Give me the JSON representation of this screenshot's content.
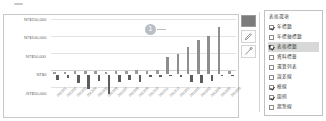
{
  "chart_data": {
    "type": "bar",
    "title": "",
    "xlabel": "",
    "ylabel": "",
    "ylim": [
      -50000,
      150000
    ],
    "grid": true,
    "legend_position": "right-panel",
    "ytick_labels": [
      "NT$150,000",
      "NT$100,000",
      "NT$50,000",
      "NT$0",
      "-NT$50,000"
    ],
    "ytick_values": [
      150000,
      100000,
      50000,
      0,
      -50000
    ],
    "categories": [
      "2022/01",
      "2022/02",
      "2022/03",
      "2022/04",
      "2022/05",
      "2022/06",
      "2022/07",
      "2022/08",
      "2022/09",
      "2022/10",
      "2022/11",
      "2022/12",
      "2023/01",
      "2023/02",
      "2023/03",
      "2023/04",
      "2023/05",
      "2023/06"
    ],
    "series": [
      {
        "name": "收入",
        "color": "#8e8e8e",
        "values": [
          8000,
          7000,
          9000,
          8500,
          9500,
          8000,
          9000,
          10000,
          11000,
          9000,
          12000,
          48000,
          56000,
          74000,
          92000,
          104000,
          128000,
          9000
        ]
      },
      {
        "name": "支出",
        "color": "#5d5d5d",
        "values": [
          -14000,
          -9000,
          -22000,
          -40000,
          -17000,
          -52000,
          -20000,
          -16000,
          -21000,
          -7000,
          -6000,
          -5000,
          -6000,
          -20000,
          -24000,
          -18000,
          -4000,
          -3000
        ]
      }
    ]
  },
  "toolbar": {
    "tab_handle": "drag-tab"
  },
  "selection_slider": {
    "left_handle": "slider-handle-left",
    "right_handle": "slider-handle-right"
  },
  "callouts": [
    {
      "id": "1",
      "label": "1"
    },
    {
      "id": "2",
      "label": "2"
    }
  ],
  "tools": {
    "color_swatch": "#7b7b7b",
    "pen_icon": "pen-icon",
    "brush_icon": "brush-icon"
  },
  "panel": {
    "title": "表格選項",
    "items": [
      {
        "label": "年標題",
        "checked": true,
        "selected": false
      },
      {
        "label": "年標軸標題",
        "checked": false,
        "selected": false
      },
      {
        "label": "表格標題",
        "checked": true,
        "selected": true
      },
      {
        "label": "資料標籤",
        "checked": false,
        "selected": false
      },
      {
        "label": "運算列表",
        "checked": false,
        "selected": false
      },
      {
        "label": "誤差線",
        "checked": false,
        "selected": false
      },
      {
        "label": "模線",
        "checked": true,
        "selected": false
      },
      {
        "label": "圖例",
        "checked": true,
        "selected": false
      },
      {
        "label": "趨勢線",
        "checked": false,
        "selected": false
      }
    ]
  }
}
